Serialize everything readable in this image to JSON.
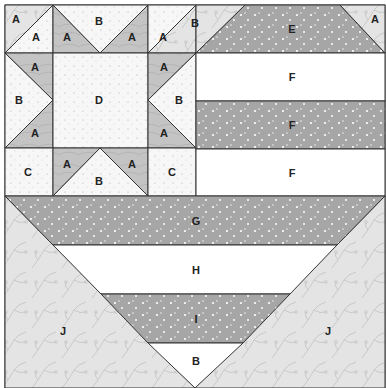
{
  "colors": {
    "line": "#333333",
    "dark_dot": "#a6a6a6",
    "medium_wood": "#c8c8c8",
    "light_vine": "#e6e6e6",
    "white_speck": "#f8f8f8",
    "white": "#ffffff"
  },
  "labels": {
    "star_tl_outer": "A",
    "star_tl_inner": "A",
    "star_top_left_a": "A",
    "star_top_b": "B",
    "star_top_right_a": "A",
    "star_tr_inner": "A",
    "star_tr_outer": "B",
    "star_ml_top_a": "A",
    "star_ml_b": "B",
    "star_ml_bot_a": "A",
    "star_center": "D",
    "star_mr_top_a": "A",
    "star_mr_b": "B",
    "star_mr_bot_a": "A",
    "star_bl_c": "C",
    "star_bot_left_a": "A",
    "star_bot_b": "B",
    "star_bot_right_a": "A",
    "star_br_c": "C",
    "stripe_e": "E",
    "corner_a": "A",
    "stripe_f1": "F",
    "stripe_f2": "F",
    "stripe_f3": "F",
    "stripe_g": "G",
    "stripe_h": "H",
    "stripe_i": "I",
    "bottom_b": "B",
    "left_j": "J",
    "right_j": "J"
  }
}
